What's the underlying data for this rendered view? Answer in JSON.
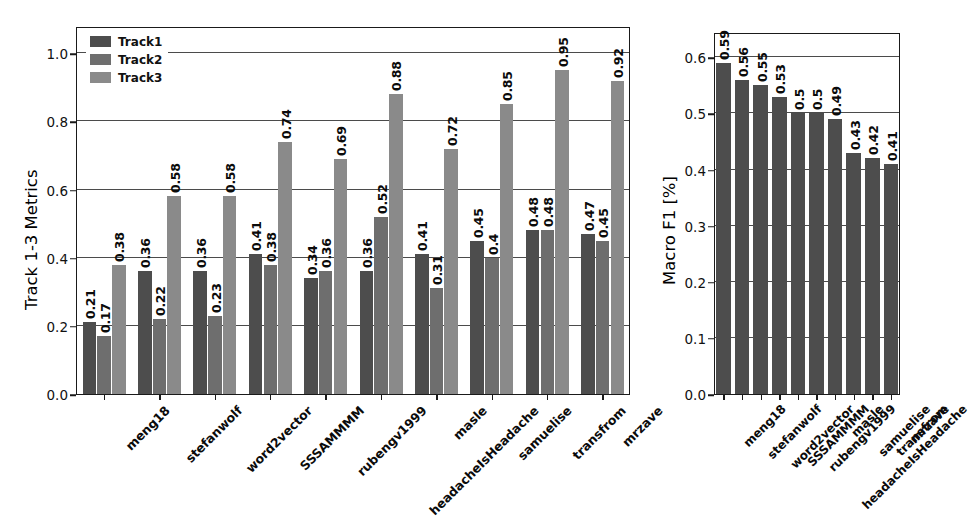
{
  "chart_data": [
    {
      "id": "left",
      "type": "bar",
      "title": "",
      "xlabel": "",
      "ylabel": "Track 1-3 Metrics",
      "ylim": [
        0.0,
        1.08
      ],
      "yticks": [
        0.0,
        0.2,
        0.4,
        0.6,
        0.8,
        1.0
      ],
      "ytick_labels": [
        "0.0",
        "0.2",
        "0.4",
        "0.6",
        "0.8",
        "1.0"
      ],
      "grid": true,
      "legend_position": "upper left",
      "categories": [
        "meng18",
        "stefanwolf",
        "word2vector",
        "SSSAMMMM",
        "rubengv1999",
        "headacheIsHeadache",
        "masle",
        "samuelise",
        "transfrom",
        "mrzave"
      ],
      "series": [
        {
          "name": "Track1",
          "color": "#4d4d4d",
          "values": [
            0.21,
            0.36,
            0.36,
            0.41,
            0.34,
            0.36,
            0.41,
            0.45,
            0.48,
            0.47
          ],
          "labels": [
            "0.21",
            "0.36",
            "0.36",
            "0.41",
            "0.34",
            "0.36",
            "0.41",
            "0.45",
            "0.48",
            "0.47"
          ]
        },
        {
          "name": "Track2",
          "color": "#6e6e6e",
          "values": [
            0.17,
            0.22,
            0.23,
            0.38,
            0.36,
            0.52,
            0.31,
            0.4,
            0.48,
            0.45
          ],
          "labels": [
            "0.17",
            "0.22",
            "0.23",
            "0.38",
            "0.36",
            "0.52",
            "0.31",
            "0.4",
            "0.48",
            "0.45"
          ]
        },
        {
          "name": "Track3",
          "color": "#8a8a8a",
          "values": [
            0.38,
            0.58,
            0.58,
            0.74,
            0.69,
            0.88,
            0.72,
            0.85,
            0.95,
            0.92
          ],
          "labels": [
            "0.38",
            "0.58",
            "0.58",
            "0.74",
            "0.69",
            "0.88",
            "0.72",
            "0.85",
            "0.95",
            "0.92"
          ]
        }
      ]
    },
    {
      "id": "right",
      "type": "bar",
      "title": "",
      "xlabel": "",
      "ylabel": "Macro F1 [%]",
      "ylim": [
        0.0,
        0.645
      ],
      "yticks": [
        0.0,
        0.1,
        0.2,
        0.3,
        0.4,
        0.5,
        0.6
      ],
      "ytick_labels": [
        "0.0",
        "0.1",
        "0.2",
        "0.3",
        "0.4",
        "0.5",
        "0.6"
      ],
      "grid": true,
      "legend_position": "none",
      "categories": [
        "meng18",
        "stefanwolf",
        "word2vector",
        "SSSAMMMM",
        "rubengv1999",
        "headacheIsHeadache",
        "masle",
        "samuelise",
        "transfrom",
        "mrzave"
      ],
      "series": [
        {
          "name": "Macro F1",
          "color": "#4d4d4d",
          "values": [
            0.59,
            0.56,
            0.55,
            0.53,
            0.5,
            0.5,
            0.49,
            0.43,
            0.42,
            0.41
          ],
          "labels": [
            "0.59",
            "0.56",
            "0.55",
            "0.53",
            "0.5",
            "0.5",
            "0.49",
            "0.43",
            "0.42",
            "0.41"
          ]
        }
      ]
    }
  ],
  "left_chart": {
    "ylabel": "Track 1-3 Metrics",
    "legend": {
      "items": [
        {
          "label": "Track1",
          "color": "#4d4d4d"
        },
        {
          "label": "Track2",
          "color": "#6e6e6e"
        },
        {
          "label": "Track3",
          "color": "#8a8a8a"
        }
      ]
    }
  },
  "right_chart": {
    "ylabel": "Macro F1 [%]"
  }
}
